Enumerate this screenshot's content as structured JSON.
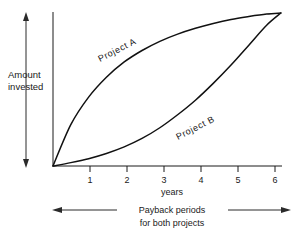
{
  "chart_data": {
    "type": "line",
    "title": "",
    "xlabel": "years",
    "ylabel": "Amount invested",
    "xlim": [
      0,
      6.6
    ],
    "ylim": [
      0,
      1
    ],
    "grid": false,
    "legend_position": "inline-curve-labels",
    "x_ticks": [
      "1",
      "2",
      "3",
      "4",
      "5",
      "6"
    ],
    "x_tick_values": [
      1,
      2,
      3,
      4,
      5,
      6
    ],
    "y_ticks": [],
    "series": [
      {
        "name": "Project A",
        "shape": "concave-down",
        "x": [
          0,
          0.5,
          1,
          1.5,
          2,
          2.5,
          3,
          3.5,
          4,
          4.5,
          5,
          5.5,
          6,
          6.4
        ],
        "values": [
          0,
          0.27,
          0.45,
          0.58,
          0.68,
          0.755,
          0.815,
          0.862,
          0.9,
          0.932,
          0.958,
          0.977,
          0.993,
          1.0
        ]
      },
      {
        "name": "Project B",
        "shape": "concave-up",
        "x": [
          0,
          0.5,
          1,
          1.5,
          2,
          2.5,
          3,
          3.5,
          4,
          4.5,
          5,
          5.5,
          6,
          6.4
        ],
        "values": [
          0,
          0.022,
          0.048,
          0.082,
          0.125,
          0.18,
          0.25,
          0.335,
          0.43,
          0.54,
          0.66,
          0.79,
          0.92,
          1.0
        ]
      }
    ],
    "annotations": {
      "y_axis_measure": "Amount invested",
      "payback_caption_line1": "Payback  periods",
      "payback_caption_line2": "for  both  projects"
    }
  },
  "labels": {
    "y_axis_line1": "Amount",
    "y_axis_line2": "invested",
    "x_axis": "years",
    "series_a": "Project  A",
    "series_b": "Project  B",
    "caption_line1": "Payback   periods",
    "caption_line2": "for   both   projects"
  },
  "ticks": {
    "t1": "1",
    "t2": "2",
    "t3": "3",
    "t4": "4",
    "t5": "5",
    "t6": "6"
  },
  "colors": {
    "ink": "#1a1a1a",
    "curve": "#111111",
    "background": "#ffffff"
  }
}
